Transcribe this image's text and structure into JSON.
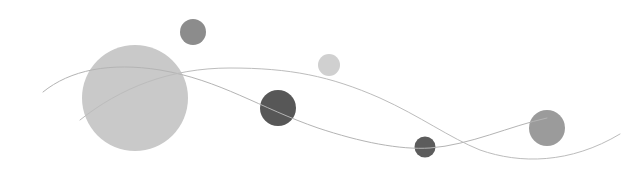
{
  "scene": {
    "width": 636,
    "height": 189,
    "background": "#ffffff",
    "curves": [
      {
        "name": "curve-a",
        "d": "M43,92 C70,70 110,62 160,70 C220,80 260,108 318,128 C360,142 400,150 430,148 C470,145 510,126 547,118",
        "stroke": "#b4b4b4",
        "width": 1
      },
      {
        "name": "curve-b",
        "d": "M80,120 C120,88 170,68 230,68 C290,68 330,76 380,98 C420,116 450,138 480,150 C520,164 570,164 620,134",
        "stroke": "#bcbcbc",
        "width": 1
      }
    ],
    "circles": [
      {
        "name": "large-light-circle",
        "cx": 135,
        "cy": 98,
        "r": 53,
        "fill": "#c9c9c9"
      },
      {
        "name": "top-medium-circle",
        "cx": 193,
        "cy": 32,
        "r": 13,
        "fill": "#8c8c8c"
      },
      {
        "name": "small-light-circle",
        "cx": 329,
        "cy": 65,
        "r": 11,
        "fill": "#d0d0d0"
      },
      {
        "name": "dark-circle",
        "cx": 278,
        "cy": 108,
        "r": 18,
        "fill": "#575757"
      },
      {
        "name": "small-dark-circle",
        "cx": 425,
        "cy": 147,
        "r": 10.5,
        "fill": "#5c5c5c"
      },
      {
        "name": "right-gray-circle",
        "cx": 547,
        "cy": 128,
        "r": 18,
        "fill": "#9b9b9b"
      }
    ]
  }
}
